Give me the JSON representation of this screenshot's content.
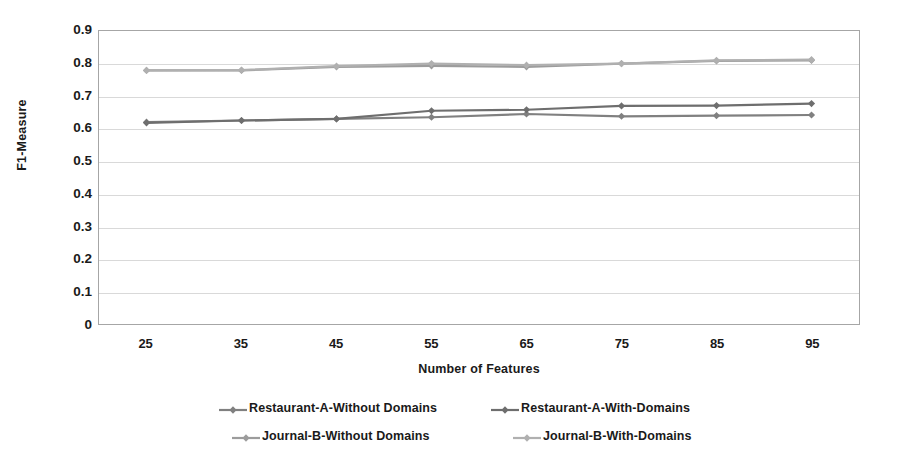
{
  "chart_data": {
    "type": "line",
    "title": "",
    "xlabel": "Number of Features",
    "ylabel": "F1-Measure",
    "x": [
      25,
      35,
      45,
      55,
      65,
      75,
      85,
      95
    ],
    "categories": [
      "25",
      "35",
      "45",
      "55",
      "65",
      "75",
      "85",
      "95"
    ],
    "xlim": [
      20,
      100
    ],
    "ylim": [
      0,
      0.9
    ],
    "y_ticks": [
      "0",
      "0.1",
      "0.2",
      "0.3",
      "0.4",
      "0.5",
      "0.6",
      "0.7",
      "0.8",
      "0.9"
    ],
    "y_tick_values": [
      0,
      0.1,
      0.2,
      0.3,
      0.4,
      0.5,
      0.6,
      0.7,
      0.8,
      0.9
    ],
    "grid": true,
    "legend_position": "bottom",
    "series": [
      {
        "name": "Restaurant-A-Without Domains",
        "color": "#808080",
        "marker": "diamond",
        "values": [
          0.62,
          0.625,
          0.63,
          0.635,
          0.645,
          0.638,
          0.64,
          0.642
        ]
      },
      {
        "name": "Restaurant-A-With-Domains",
        "color": "#6e6e6e",
        "marker": "diamond",
        "values": [
          0.618,
          0.625,
          0.63,
          0.655,
          0.658,
          0.67,
          0.671,
          0.677
        ]
      },
      {
        "name": "Journal-B-Without Domains",
        "color": "#9c9c9c",
        "marker": "diamond",
        "values": [
          0.779,
          0.779,
          0.79,
          0.793,
          0.79,
          0.8,
          0.808,
          0.81
        ]
      },
      {
        "name": "Journal-B-With-Domains",
        "color": "#b0b0b0",
        "marker": "diamond",
        "values": [
          0.779,
          0.78,
          0.792,
          0.8,
          0.795,
          0.8,
          0.81,
          0.812
        ]
      }
    ]
  },
  "legend": {
    "rows": [
      [
        "Restaurant-A-Without Domains",
        "Restaurant-A-With-Domains"
      ],
      [
        "Journal-B-Without Domains",
        "Journal-B-With-Domains"
      ]
    ]
  }
}
